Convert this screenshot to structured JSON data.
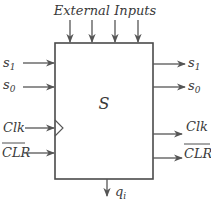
{
  "diagram": {
    "title": "External Inputs",
    "block_label": "S",
    "inputs_left": [
      {
        "label": "s",
        "sub": "1",
        "overline": false
      },
      {
        "label": "s",
        "sub": "0",
        "overline": false
      },
      {
        "label": "Clk",
        "sub": "",
        "overline": false,
        "clock": true
      },
      {
        "label": "CLR",
        "sub": "",
        "overline": true
      }
    ],
    "outputs_right": [
      {
        "label": "s",
        "sub": "1",
        "overline": false
      },
      {
        "label": "s",
        "sub": "0",
        "overline": false
      },
      {
        "label": "Clk",
        "sub": "",
        "overline": false
      },
      {
        "label": "CLR",
        "sub": "",
        "overline": true
      }
    ],
    "external_input_count": 4,
    "output_bottom": {
      "label": "q",
      "sub": "i"
    },
    "colors": {
      "line": "#555555",
      "text": "#3a3a3a",
      "background": "#ffffff"
    }
  }
}
